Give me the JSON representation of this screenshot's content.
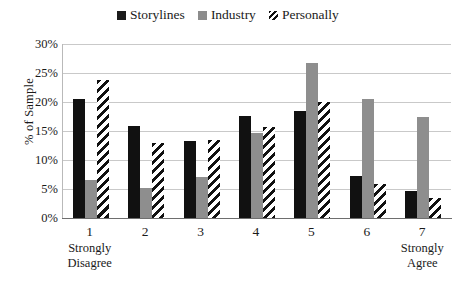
{
  "chart_data": {
    "type": "bar",
    "title": "",
    "xlabel": "",
    "ylabel": "% of Sample",
    "ylim": [
      0,
      30
    ],
    "ytick_labels": [
      "30%",
      "25%",
      "20%",
      "15%",
      "10%",
      "5%",
      "0%"
    ],
    "ytick_values": [
      30,
      25,
      20,
      15,
      10,
      5,
      0
    ],
    "grid": true,
    "legend_position": "top-center",
    "categories": [
      "1",
      "2",
      "3",
      "4",
      "5",
      "6",
      "7"
    ],
    "category_captions": [
      "Strongly Disagree",
      "",
      "",
      "",
      "",
      "",
      "Strongly Agree"
    ],
    "series": [
      {
        "name": "Storylines",
        "color": "#111111",
        "fill": "solid",
        "values": [
          20.5,
          15.8,
          13.2,
          17.6,
          18.4,
          7.3,
          4.7
        ]
      },
      {
        "name": "Industry",
        "color": "#8e8e8e",
        "fill": "solid",
        "values": [
          6.5,
          5.1,
          7.0,
          14.6,
          26.7,
          20.5,
          17.4
        ]
      },
      {
        "name": "Personally",
        "color": "#111111",
        "fill": "hatched",
        "values": [
          23.8,
          13.0,
          13.4,
          15.7,
          20.0,
          5.8,
          3.5
        ]
      }
    ]
  },
  "legend": {
    "items": [
      {
        "label": "Storylines",
        "swatch": "legend-swatch-storylines"
      },
      {
        "label": "Industry",
        "swatch": "legend-swatch-industry"
      },
      {
        "label": "Personally",
        "swatch": "legend-swatch-personally"
      }
    ]
  },
  "axis": {
    "y_title": "% of Sample"
  }
}
